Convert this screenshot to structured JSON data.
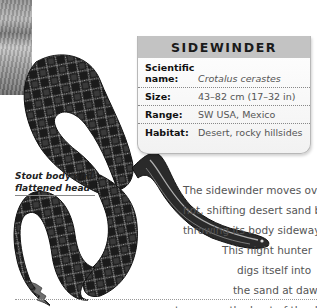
{
  "info_box": {
    "title": "SIDEWINDER",
    "rows": [
      {
        "label_line1": "Scientific",
        "label_line2": "name:",
        "value": "Crotalus cerastes"
      },
      {
        "label": "Size:",
        "value": "43–82 cm (17–32 in)"
      },
      {
        "label": "Range:",
        "value": "SW USA, Mexico"
      },
      {
        "label": "Habitat:",
        "value": "Desert, rocky hillsides"
      }
    ]
  },
  "caption": {
    "line1": "Stout body and",
    "line2": "flattened head"
  },
  "body_text": {
    "lines": [
      "The sidewinder moves over",
      "hot, shifting desert sand by",
      "throwing its body sideways.",
      "This night hunter",
      "digs itself into",
      "the sand at dawn",
      "to escape the heat of the day."
    ]
  },
  "colors": {
    "header_band": "#c3c3c3",
    "label_text": "#111111",
    "value_text": "#555555",
    "snake_dark": "#1a1a1a",
    "snake_pattern": "#9a9a9a"
  }
}
